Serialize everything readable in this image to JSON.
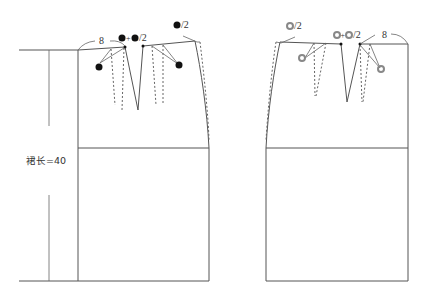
{
  "diagram": {
    "colors": {
      "line": "#555555",
      "dot_symbol": "#111111",
      "ring_symbol": "#888888",
      "background": "#ffffff"
    },
    "dimension": {
      "label": "裙长=40"
    },
    "front_panel": {
      "side_ease_label": "8",
      "dart_width_label_center": "●+●/2",
      "dart_width_label_side": "●/2",
      "dart_symbol": "filled-dot"
    },
    "back_panel": {
      "side_ease_label": "8",
      "dart_width_label_center": "○+○/2",
      "dart_width_label_side": "○/2",
      "dart_symbol": "ring"
    },
    "labels": {
      "left_8": "8",
      "left_slash2_center": "/2",
      "left_slash2_side": "/2",
      "right_8": "8",
      "right_slash2_center": "/2",
      "right_slash2_side": "/2",
      "plus": "+"
    }
  }
}
